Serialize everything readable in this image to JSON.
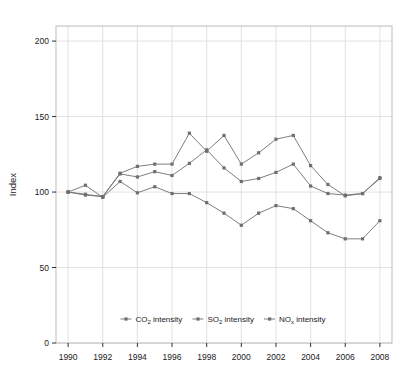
{
  "chart_data": {
    "type": "line",
    "title": "",
    "subtitle": "",
    "xlabel": "",
    "ylabel": "Index",
    "x": [
      1990,
      1991,
      1992,
      1993,
      1994,
      1995,
      1996,
      1997,
      1998,
      1999,
      2000,
      2001,
      2002,
      2003,
      2004,
      2005,
      2006,
      2007,
      2008
    ],
    "xlim": [
      1989.3,
      2008.7
    ],
    "ylim": [
      0,
      210
    ],
    "xticks": [
      1990,
      1992,
      1994,
      1996,
      1998,
      2000,
      2002,
      2004,
      2006,
      2008
    ],
    "xtick_labels": [
      "1990",
      "1992",
      "1994",
      "1996",
      "1998",
      "2000",
      "2002",
      "2004",
      "2006",
      "2008"
    ],
    "yticks": [
      0,
      50,
      100,
      150,
      200
    ],
    "ytick_labels": [
      "0",
      "50",
      "100",
      "150",
      "200"
    ],
    "grid": "vertical-at-xticks-and-horizontal-at-yticks",
    "legend_position": "inside-bottom-center",
    "marker": "square",
    "series": [
      {
        "name": "CO2 intensity",
        "label_main": "CO",
        "label_sub": "2",
        "label_tail": " intensity",
        "color": "#6f6f6f",
        "values": [
          100,
          98,
          97,
          112,
          110,
          113.5,
          111,
          119,
          128,
          116,
          107,
          109,
          113,
          118.5,
          104,
          99,
          98,
          99,
          109
        ]
      },
      {
        "name": "SO2 intensity",
        "label_main": "SO",
        "label_sub": "2",
        "label_tail": " intensity",
        "color": "#6f6f6f",
        "values": [
          100,
          104.5,
          96.5,
          107,
          99.5,
          103.5,
          99,
          99,
          93,
          86,
          78,
          86,
          91,
          89,
          81,
          73,
          69,
          69,
          81
        ]
      },
      {
        "name": "NOx intensity",
        "label_main": "NO",
        "label_sub": "x",
        "label_tail": " intensity",
        "color": "#6f6f6f",
        "values": [
          100,
          98.5,
          97,
          112.5,
          117,
          118.5,
          118.5,
          139,
          127,
          137.5,
          118.5,
          126,
          135,
          137.5,
          117.5,
          105,
          97.5,
          99,
          109.5
        ]
      }
    ]
  },
  "style": {
    "grid_color": "#d9d9d9",
    "frame_color": "#b5b5b5",
    "line_color": "#6f6f6f",
    "text_color": "#1a1a1a",
    "background": "#ffffff"
  }
}
